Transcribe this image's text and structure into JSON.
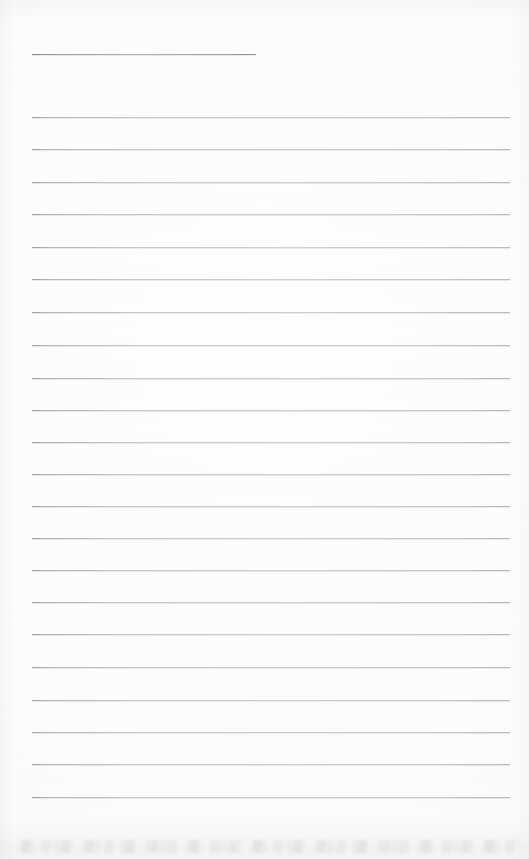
{
  "document": {
    "kind": "scanned-lined-notepad-page",
    "page_title": "Blank ruled notepad page",
    "content_text": "",
    "is_blank": true,
    "page_width_px": 529,
    "page_height_px": 859,
    "paper_color": "#fdfdfd",
    "rule_color": "#b8bcc2",
    "accent_rule_color": "#8d9197",
    "rule_thickness_px": 1,
    "left_margin_px": 32,
    "right_margin_px": 510,
    "line_spacing_px": 32.3,
    "total_rules": 24,
    "full_width_rules": 23
  },
  "rules": [
    {
      "id": "rule-title",
      "label": "Title rule",
      "y": 54,
      "x_start": 32,
      "x_end": 256,
      "variant": "short"
    },
    {
      "id": "rule-01",
      "label": "Ruled line 1",
      "y": 117,
      "x_start": 32,
      "x_end": 510,
      "variant": "full"
    },
    {
      "id": "rule-02",
      "label": "Ruled line 2",
      "y": 149,
      "x_start": 32,
      "x_end": 510,
      "variant": "full"
    },
    {
      "id": "rule-03",
      "label": "Ruled line 3",
      "y": 182,
      "x_start": 32,
      "x_end": 510,
      "variant": "full"
    },
    {
      "id": "rule-04",
      "label": "Ruled line 4",
      "y": 214,
      "x_start": 32,
      "x_end": 510,
      "variant": "full"
    },
    {
      "id": "rule-05",
      "label": "Ruled line 5",
      "y": 247,
      "x_start": 32,
      "x_end": 510,
      "variant": "full"
    },
    {
      "id": "rule-06",
      "label": "Ruled line 6",
      "y": 279,
      "x_start": 32,
      "x_end": 510,
      "variant": "full"
    },
    {
      "id": "rule-07",
      "label": "Ruled line 7",
      "y": 312,
      "x_start": 32,
      "x_end": 510,
      "variant": "full"
    },
    {
      "id": "rule-08",
      "label": "Ruled line 8",
      "y": 345,
      "x_start": 32,
      "x_end": 510,
      "variant": "full"
    },
    {
      "id": "rule-09",
      "label": "Ruled line 9",
      "y": 378,
      "x_start": 32,
      "x_end": 510,
      "variant": "full"
    },
    {
      "id": "rule-10",
      "label": "Ruled line 10",
      "y": 410,
      "x_start": 32,
      "x_end": 510,
      "variant": "full"
    },
    {
      "id": "rule-11",
      "label": "Ruled line 11",
      "y": 442,
      "x_start": 32,
      "x_end": 510,
      "variant": "full"
    },
    {
      "id": "rule-12",
      "label": "Ruled line 12",
      "y": 474,
      "x_start": 32,
      "x_end": 510,
      "variant": "full"
    },
    {
      "id": "rule-13",
      "label": "Ruled line 13",
      "y": 506,
      "x_start": 32,
      "x_end": 510,
      "variant": "full"
    },
    {
      "id": "rule-14",
      "label": "Ruled line 14",
      "y": 538,
      "x_start": 32,
      "x_end": 510,
      "variant": "full"
    },
    {
      "id": "rule-15",
      "label": "Ruled line 15",
      "y": 570,
      "x_start": 32,
      "x_end": 510,
      "variant": "full"
    },
    {
      "id": "rule-16",
      "label": "Ruled line 16",
      "y": 602,
      "x_start": 32,
      "x_end": 510,
      "variant": "full"
    },
    {
      "id": "rule-17",
      "label": "Ruled line 17",
      "y": 634,
      "x_start": 32,
      "x_end": 510,
      "variant": "full"
    },
    {
      "id": "rule-18",
      "label": "Ruled line 18",
      "y": 667,
      "x_start": 32,
      "x_end": 510,
      "variant": "full"
    },
    {
      "id": "rule-19",
      "label": "Ruled line 19",
      "y": 700,
      "x_start": 32,
      "x_end": 510,
      "variant": "full"
    },
    {
      "id": "rule-20",
      "label": "Ruled line 20",
      "y": 732,
      "x_start": 32,
      "x_end": 510,
      "variant": "full"
    },
    {
      "id": "rule-21",
      "label": "Ruled line 21",
      "y": 764,
      "x_start": 32,
      "x_end": 510,
      "variant": "full"
    },
    {
      "id": "rule-22",
      "label": "Ruled line 22",
      "y": 797,
      "x_start": 32,
      "x_end": 510,
      "variant": "full"
    }
  ]
}
